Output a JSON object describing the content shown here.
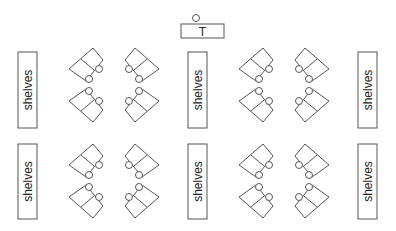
{
  "diagram": {
    "type": "classroom-floor-plan",
    "colors": {
      "stroke": "#555555",
      "background": "#ffffff",
      "text": "#222222"
    },
    "teacher": {
      "label": "T",
      "box": [
        181,
        24,
        43,
        14
      ],
      "seat": [
        196,
        18
      ]
    },
    "shelves": [
      {
        "label": "shelves",
        "box": [
          18,
          52,
          19,
          76
        ]
      },
      {
        "label": "shelves",
        "box": [
          188,
          52,
          19,
          76
        ]
      },
      {
        "label": "shelves",
        "box": [
          358,
          52,
          19,
          76
        ]
      },
      {
        "label": "shelves",
        "box": [
          18,
          144,
          19,
          75
        ]
      },
      {
        "label": "shelves",
        "box": [
          188,
          144,
          19,
          75
        ]
      },
      {
        "label": "shelves",
        "box": [
          358,
          144,
          19,
          75
        ]
      }
    ],
    "desk_clusters": [
      {
        "center": [
          114,
          85
        ],
        "desks": 8,
        "seats": 8
      },
      {
        "center": [
          284,
          85
        ],
        "desks": 8,
        "seats": 8
      },
      {
        "center": [
          114,
          181
        ],
        "desks": 8,
        "seats": 8
      },
      {
        "center": [
          284,
          181
        ],
        "desks": 8,
        "seats": 8
      }
    ]
  }
}
